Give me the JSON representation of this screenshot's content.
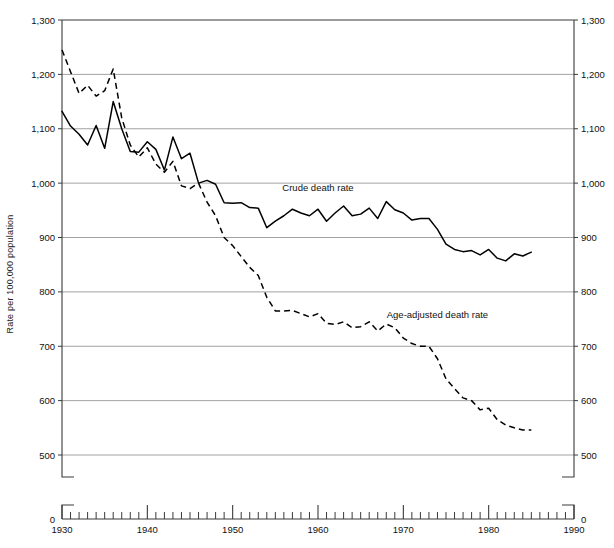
{
  "chart_data": {
    "type": "line",
    "title": "",
    "xlabel": "",
    "ylabel": "Rate per 100,000 population",
    "xlim": [
      1930,
      1990
    ],
    "ylim": [
      500,
      1300
    ],
    "y_axis_break_to_zero": true,
    "grid": true,
    "legend_position": "inline-annotation",
    "y_ticks": [
      "0",
      "500",
      "600",
      "700",
      "800",
      "900",
      "1,000",
      "1,100",
      "1,200",
      "1,300"
    ],
    "y_tick_values": [
      0,
      500,
      600,
      700,
      800,
      900,
      1000,
      1100,
      1200,
      1300
    ],
    "y_ticks_right": [
      "0",
      "500",
      "600",
      "700",
      "800",
      "900",
      "1,000",
      "1,100",
      "1,200",
      "1,300"
    ],
    "x_ticks": [
      "1930",
      "1940",
      "1950",
      "1960",
      "1970",
      "1980",
      "1990"
    ],
    "x_tick_values": [
      1930,
      1940,
      1950,
      1960,
      1970,
      1980,
      1990
    ],
    "x_minor_tick_interval": 1,
    "x": [
      1930,
      1931,
      1932,
      1933,
      1934,
      1935,
      1936,
      1937,
      1938,
      1939,
      1940,
      1941,
      1942,
      1943,
      1944,
      1945,
      1946,
      1947,
      1948,
      1949,
      1950,
      1951,
      1952,
      1953,
      1954,
      1955,
      1956,
      1957,
      1958,
      1959,
      1960,
      1961,
      1962,
      1963,
      1964,
      1965,
      1966,
      1967,
      1968,
      1969,
      1970,
      1971,
      1972,
      1973,
      1974,
      1975,
      1976,
      1977,
      1978,
      1979,
      1980,
      1981,
      1982,
      1983,
      1984,
      1985
    ],
    "series": [
      {
        "name": "Crude death rate",
        "style": "solid",
        "label_x": 1960,
        "label_y": 985,
        "values": [
          1132,
          1105,
          1090,
          1070,
          1106,
          1064,
          1150,
          1100,
          1058,
          1057,
          1076,
          1062,
          1024,
          1085,
          1045,
          1055,
          1000,
          1005,
          998,
          964,
          963,
          964,
          955,
          954,
          918,
          930,
          940,
          952,
          945,
          940,
          952,
          930,
          945,
          958,
          940,
          943,
          954,
          935,
          966,
          951,
          945,
          932,
          935,
          935,
          915,
          888,
          878,
          874,
          876,
          868,
          878,
          862,
          857,
          870,
          866,
          873
        ]
      },
      {
        "name": "Age-adjusted death rate",
        "style": "dashed",
        "label_x": 1974,
        "label_y": 752,
        "values": [
          1245,
          1205,
          1165,
          1180,
          1160,
          1170,
          1210,
          1120,
          1070,
          1048,
          1065,
          1035,
          1020,
          1040,
          995,
          990,
          1000,
          965,
          940,
          900,
          885,
          865,
          845,
          830,
          790,
          765,
          765,
          766,
          760,
          754,
          760,
          742,
          740,
          745,
          734,
          736,
          745,
          728,
          741,
          734,
          715,
          705,
          700,
          700,
          677,
          640,
          622,
          605,
          600,
          583,
          586,
          565,
          555,
          550,
          546,
          546
        ]
      }
    ]
  },
  "annotations": {
    "crude_label": "Crude death rate",
    "age_adjusted_label": "Age-adjusted death rate"
  }
}
